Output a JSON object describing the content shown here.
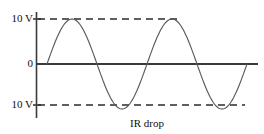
{
  "figure": {
    "caption": "IR drop",
    "background_color": "#ffffff",
    "axis_color": "#3a3a3a",
    "curve_color": "#5a5a5a",
    "dash_color": "#2b2b2b",
    "text_color": "#111111"
  },
  "axis": {
    "y_labels": {
      "top": "10 V",
      "zero": "0",
      "bottom": "10 V"
    }
  },
  "chart_data": {
    "type": "line",
    "title": "",
    "subtitle": "",
    "xlabel": "IR drop",
    "ylabel": "",
    "grid": false,
    "legend": null,
    "ylim": [
      -10,
      10
    ],
    "ytick_labels": [
      "10 V",
      "0",
      "10 V"
    ],
    "ytick_values": [
      10,
      0,
      -10
    ],
    "xlim": [
      0,
      2.2
    ],
    "xtick_labels": [],
    "annotations": [
      {
        "text": "10 V",
        "type": "y-axis-tick",
        "value": 10
      },
      {
        "text": "0",
        "type": "y-axis-tick",
        "value": 0
      },
      {
        "text": "10 V",
        "type": "y-axis-tick",
        "value": -10
      },
      {
        "text": "IR drop",
        "type": "x-axis-caption"
      }
    ],
    "reference_lines": [
      {
        "value": 10,
        "style": "dashed",
        "label": "10 V"
      },
      {
        "value": -10,
        "style": "dashed",
        "label": "10 V"
      },
      {
        "value": 0,
        "style": "solid",
        "label": "0"
      }
    ],
    "series": [
      {
        "name": "IR drop waveform",
        "waveform": "sine",
        "amplitude": 10,
        "cycles": 2,
        "phase_start": 0,
        "units": "V",
        "x": [
          0.0,
          0.05,
          0.1,
          0.15,
          0.2,
          0.25,
          0.3,
          0.35,
          0.4,
          0.45,
          0.5,
          0.55,
          0.6,
          0.65,
          0.7,
          0.75,
          0.8,
          0.85,
          0.9,
          0.95,
          1.0,
          1.05,
          1.1,
          1.15,
          1.2,
          1.25,
          1.3,
          1.35,
          1.4,
          1.45,
          1.5,
          1.55,
          1.6,
          1.65,
          1.7,
          1.75,
          1.8,
          1.85,
          1.9,
          1.95,
          2.0
        ],
        "values": [
          0.0,
          3.09,
          5.88,
          8.09,
          9.51,
          10.0,
          9.51,
          8.09,
          5.88,
          3.09,
          0.0,
          -3.09,
          -5.88,
          -8.09,
          -9.51,
          -10.0,
          -9.51,
          -8.09,
          -5.88,
          -3.09,
          0.0,
          3.09,
          5.88,
          8.09,
          9.51,
          10.0,
          9.51,
          8.09,
          5.88,
          3.09,
          0.0,
          -3.09,
          -5.88,
          -8.09,
          -9.51,
          -10.0,
          -9.51,
          -8.09,
          -5.88,
          -3.09,
          0.0
        ]
      }
    ]
  }
}
